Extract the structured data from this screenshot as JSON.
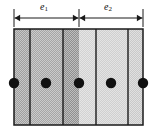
{
  "figure": {
    "type": "lattice-cross-section-diagram",
    "title_visible": false,
    "background": "#ffffff",
    "ink_color": "#1a1a1a"
  },
  "dimensions": {
    "items": [
      {
        "id": "e1",
        "label_base": "e",
        "label_sub": "1",
        "label_text": "e1",
        "x_start": 14,
        "x_end": 79,
        "span_px": 65,
        "arrow_y": 18,
        "label_x": 40,
        "label_y": 2,
        "tick_top": 9,
        "tick_bottom": 27,
        "double_headed": true
      },
      {
        "id": "e2",
        "label_base": "e",
        "label_sub": "2",
        "label_text": "e2",
        "x_start": 79,
        "x_end": 143,
        "span_px": 64,
        "arrow_y": 18,
        "label_x": 104,
        "label_y": 2,
        "tick_top": 9,
        "tick_bottom": 27,
        "double_headed": true
      }
    ]
  },
  "box": {
    "x": 14,
    "y": 29,
    "width": 129,
    "height": 96,
    "border_color": "#1a1a1a",
    "border_width": 1.5
  },
  "cells": [
    {
      "index": 0,
      "x": 14,
      "width": 16,
      "fill": "#9e9e9e",
      "region": "e1"
    },
    {
      "index": 1,
      "x": 30,
      "width": 33,
      "fill": "#a5a5a5",
      "region": "e1"
    },
    {
      "index": 2,
      "x": 63,
      "width": 16,
      "fill": "#8f8f8f",
      "region": "e1"
    },
    {
      "index": 3,
      "x": 79,
      "width": 17,
      "fill": "#d2d2d2",
      "region": "e2"
    },
    {
      "index": 4,
      "x": 96,
      "width": 32,
      "fill": "#cfcfcf",
      "region": "e2"
    },
    {
      "index": 5,
      "x": 128,
      "width": 15,
      "fill": "#c9c9c9",
      "region": "e2"
    }
  ],
  "dividers": [
    {
      "x": 30
    },
    {
      "x": 63
    },
    {
      "x": 96
    },
    {
      "x": 128
    }
  ],
  "atoms": [
    {
      "index": 0,
      "cx": 14,
      "cy": 83,
      "r": 5.2,
      "fill": "#111111",
      "on_edge": true
    },
    {
      "index": 1,
      "cx": 46,
      "cy": 83,
      "r": 5.2,
      "fill": "#111111",
      "on_edge": false
    },
    {
      "index": 2,
      "cx": 79,
      "cy": 83,
      "r": 5.2,
      "fill": "#111111",
      "on_edge": false
    },
    {
      "index": 3,
      "cx": 111,
      "cy": 83,
      "r": 5.2,
      "fill": "#111111",
      "on_edge": false
    },
    {
      "index": 4,
      "cx": 143,
      "cy": 83,
      "r": 5.2,
      "fill": "#111111",
      "on_edge": true
    }
  ]
}
